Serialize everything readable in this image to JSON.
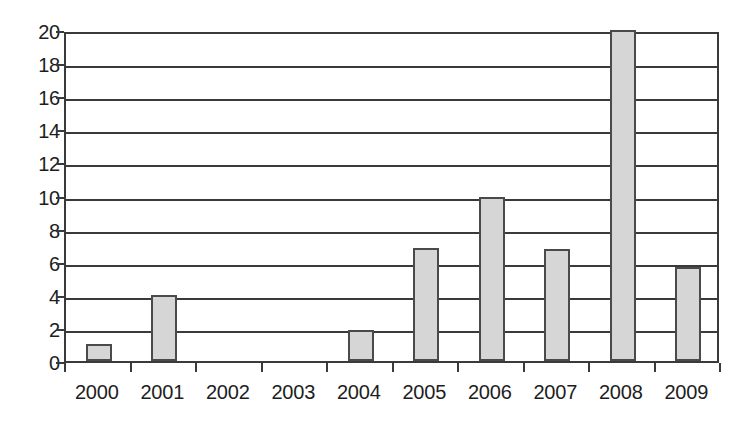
{
  "chart_data": {
    "type": "bar",
    "title": "",
    "subtitle": "",
    "xlabel": "",
    "ylabel": "",
    "categories": [
      "2000",
      "2001",
      "2002",
      "2003",
      "2004",
      "2005",
      "2006",
      "2007",
      "2008",
      "2009"
    ],
    "values": [
      1,
      4,
      0,
      0,
      1.9,
      6.8,
      9.9,
      6.75,
      20,
      5.7
    ],
    "series": [
      {
        "name": "",
        "values": [
          1,
          4,
          0,
          0,
          1.9,
          6.8,
          9.9,
          6.75,
          20,
          5.7
        ]
      }
    ],
    "ylim": [
      0,
      20
    ],
    "ytick_values": [
      0,
      2,
      4,
      6,
      8,
      10,
      12,
      14,
      16,
      18,
      20
    ],
    "ytick_labels": [
      "0",
      "2",
      "4",
      "6",
      "8",
      "10",
      "12",
      "14",
      "16",
      "18",
      "20"
    ],
    "xtick_labels": [
      "2000",
      "2001",
      "2002",
      "2003",
      "2004",
      "2005",
      "2006",
      "2007",
      "2008",
      "2009"
    ],
    "grid": "horizontal",
    "legend": "none",
    "annotations": [],
    "colors": {
      "bar_fill": "#d6d6d6",
      "bar_border": "#4a4a4a",
      "grid": "#3a3a3a",
      "axis": "#3a3a3a",
      "text": "#1d1d1d",
      "background": "#ffffff"
    }
  }
}
